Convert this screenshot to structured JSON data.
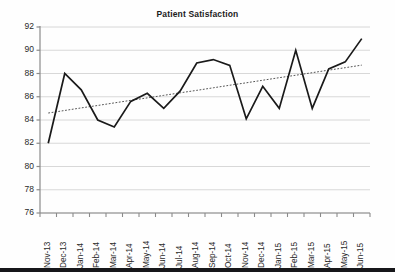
{
  "chart_data": {
    "type": "line",
    "title": "Patient Satisfaction",
    "xlabel": "",
    "ylabel": "",
    "ylim": [
      76,
      92
    ],
    "yticks": [
      76,
      78,
      80,
      82,
      84,
      86,
      88,
      90,
      92
    ],
    "grid": true,
    "legend": false,
    "legend_position": "none",
    "categories": [
      "Nov-13",
      "Dec-13",
      "Jan-14",
      "Feb-14",
      "Mar-14",
      "Apr-14",
      "May-14",
      "Jun-14",
      "Jul-14",
      "Aug-14",
      "Sep-14",
      "Oct-14",
      "Nov-14",
      "Dec-14",
      "Jan-15",
      "Feb-15",
      "Mar-15",
      "Apr-15",
      "May-15",
      "Jun-15"
    ],
    "series": [
      {
        "name": "Patient Satisfaction",
        "color": "#1a1a1a",
        "style": "solid",
        "values": [
          82.0,
          88.0,
          86.6,
          84.0,
          83.4,
          85.6,
          86.3,
          85.0,
          86.5,
          88.9,
          89.2,
          88.7,
          84.1,
          86.9,
          85.0,
          90.0,
          85.0,
          88.4,
          89.0,
          91.0
        ]
      },
      {
        "name": "Linear trend",
        "color": "#555555",
        "style": "dotted",
        "values": [
          84.6,
          84.82,
          85.04,
          85.25,
          85.47,
          85.69,
          85.9,
          86.12,
          86.34,
          86.55,
          86.77,
          86.99,
          87.2,
          87.42,
          87.64,
          87.85,
          88.07,
          88.29,
          88.5,
          88.72
        ]
      }
    ],
    "trendline": {
      "start_value": 84.6,
      "end_value": 88.72,
      "style": "dotted"
    }
  },
  "axes": {
    "y_tick_labels": [
      "92",
      "90",
      "88",
      "86",
      "84",
      "82",
      "80",
      "78",
      "76"
    ],
    "x_tick_labels": [
      "Nov-13",
      "Dec-13",
      "Jan-14",
      "Feb-14",
      "Mar-14",
      "Apr-14",
      "May-14",
      "Jun-14",
      "Jul-14",
      "Aug-14",
      "Sep-14",
      "Oct-14",
      "Nov-14",
      "Dec-14",
      "Jan-15",
      "Feb-15",
      "Mar-15",
      "Apr-15",
      "May-15",
      "Jun-15"
    ]
  },
  "colors": {
    "series_line": "#1a1a1a",
    "trend_line": "#555555",
    "gridline": "#d4d4d4",
    "axis": "#8a8a8a",
    "text": "#2a2a2a",
    "background": "#fefefe"
  }
}
